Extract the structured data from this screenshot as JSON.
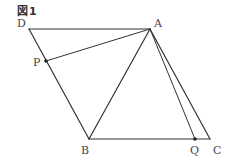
{
  "figure": {
    "title": "図1",
    "line_color": "#333333",
    "point_color": "#222222"
  },
  "points": {
    "A": {
      "label": "A",
      "x": 150,
      "y": 29
    },
    "B": {
      "label": "B",
      "x": 89,
      "y": 139
    },
    "C": {
      "label": "C",
      "x": 210,
      "y": 139
    },
    "D": {
      "label": "D",
      "x": 29,
      "y": 29
    },
    "P": {
      "label": "P",
      "x": 46,
      "y": 61
    },
    "Q": {
      "label": "Q",
      "x": 195,
      "y": 139
    }
  },
  "segments": [
    [
      "D",
      "A"
    ],
    [
      "D",
      "B"
    ],
    [
      "B",
      "C"
    ],
    [
      "A",
      "C"
    ],
    [
      "A",
      "B"
    ],
    [
      "A",
      "P"
    ],
    [
      "A",
      "Q"
    ]
  ],
  "marked_points": [
    "P",
    "Q"
  ]
}
